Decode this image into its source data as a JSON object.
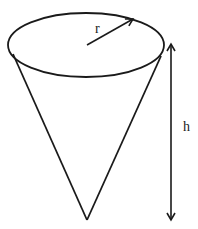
{
  "diagram": {
    "type": "cone",
    "labels": {
      "radius": "r",
      "height": "h"
    },
    "colors": {
      "stroke": "#1a1a1a",
      "background": "#ffffff"
    }
  }
}
